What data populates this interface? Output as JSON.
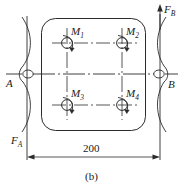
{
  "figure": {
    "caption": "(b)",
    "plate": {
      "shape": "rounded-rectangle",
      "corner_radius": 14
    }
  },
  "moments": [
    {
      "id": "M1",
      "base": "M",
      "sub": "1",
      "direction": "clockwise",
      "cx": 67,
      "cy": 43
    },
    {
      "id": "M2",
      "base": "M",
      "sub": "2",
      "direction": "clockwise",
      "cx": 122,
      "cy": 43
    },
    {
      "id": "M3",
      "base": "M",
      "sub": "3",
      "direction": "clockwise",
      "cx": 67,
      "cy": 105
    },
    {
      "id": "M4",
      "base": "M",
      "sub": "4",
      "direction": "clockwise",
      "cx": 122,
      "cy": 105
    }
  ],
  "nodes": [
    {
      "id": "A",
      "label": "A",
      "side": "left"
    },
    {
      "id": "B",
      "label": "B",
      "side": "right"
    }
  ],
  "forces": [
    {
      "id": "FB",
      "base": "F",
      "sub": "B",
      "direction": "up",
      "x": 160,
      "y_tip": 6
    },
    {
      "id": "FA",
      "base": "F",
      "sub": "A",
      "direction": "down",
      "x": 27,
      "y_tip": 158
    }
  ],
  "dimensions": [
    {
      "id": "span",
      "value": "200",
      "from": "A",
      "to": "B",
      "y": 157
    }
  ],
  "colors": {
    "line": "#2b2b2b",
    "text": "#1a1a1a",
    "background": "#ffffff"
  }
}
